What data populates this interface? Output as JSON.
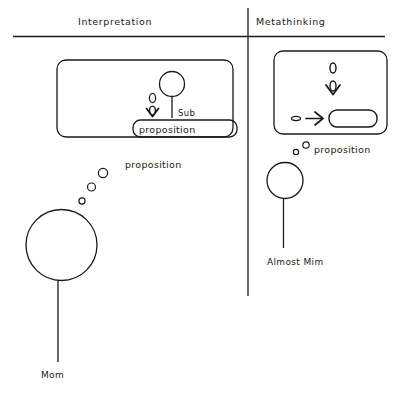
{
  "figure": {
    "background_color": "#ffffff",
    "ink_color": "#1a1a1a",
    "columns": [
      {
        "id": "interpretation",
        "title": "Interpretation"
      },
      {
        "id": "metathinking",
        "title": "Metathinking"
      }
    ]
  },
  "left_panel": {
    "thought_box": {
      "inner_label": "proposition",
      "sub_label": "Sub",
      "zero_glyph": "0"
    },
    "outside_label": "proposition",
    "person_label": "Mom",
    "bubble_count": 3
  },
  "right_panel": {
    "thought_box": {
      "inner_label": "",
      "pill_label": ""
    },
    "outside_label": "proposition",
    "person_label": "Almost Mim",
    "bubble_count": 2
  }
}
